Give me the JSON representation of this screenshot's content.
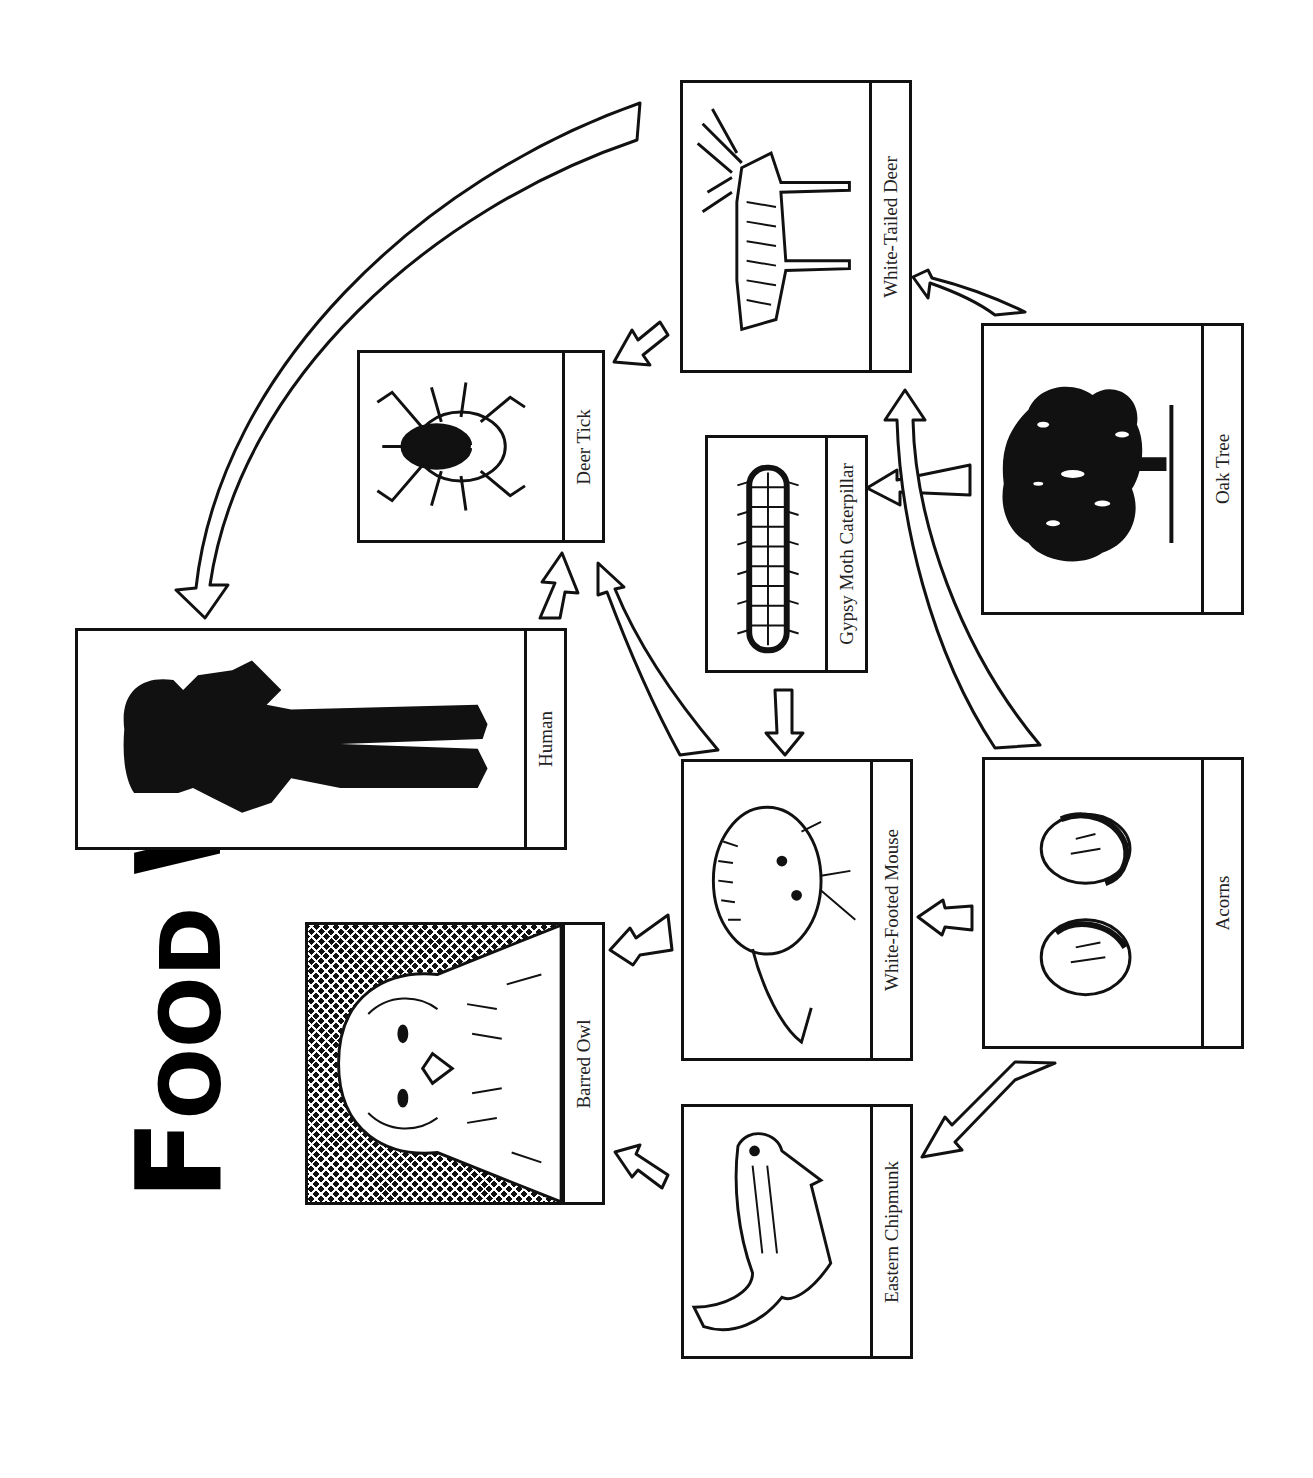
{
  "title": {
    "first_letter": "F",
    "rest_word1": "OOD",
    "second_word_first": "W",
    "rest_word2": "EB",
    "full": "Food Web"
  },
  "orientation": "rotated 90 degrees counter-clockwise",
  "organisms": [
    {
      "id": "deer",
      "label": "White-Tailed Deer",
      "icon": "deer-icon"
    },
    {
      "id": "tick",
      "label": "Deer Tick",
      "icon": "tick-icon"
    },
    {
      "id": "caterpillar",
      "label": "Gypsy Moth Caterpillar",
      "icon": "caterpillar-icon"
    },
    {
      "id": "oak",
      "label": "Oak Tree",
      "icon": "oak-tree-icon"
    },
    {
      "id": "human",
      "label": "Human",
      "icon": "human-silhouette-icon"
    },
    {
      "id": "mouse",
      "label": "White-Footed Mouse",
      "icon": "mouse-icon"
    },
    {
      "id": "acorns",
      "label": "Acorns",
      "icon": "acorns-icon"
    },
    {
      "id": "owl",
      "label": "Barred Owl",
      "icon": "owl-icon"
    },
    {
      "id": "chipmunk",
      "label": "Eastern Chipmunk",
      "icon": "chipmunk-icon"
    }
  ],
  "links": [
    {
      "from": "Oak Tree",
      "to": "White-Tailed Deer"
    },
    {
      "from": "Oak Tree",
      "to": "Gypsy Moth Caterpillar"
    },
    {
      "from": "Acorns",
      "to": "White-Tailed Deer"
    },
    {
      "from": "Acorns",
      "to": "White-Footed Mouse"
    },
    {
      "from": "Acorns",
      "to": "Eastern Chipmunk"
    },
    {
      "from": "Gypsy Moth Caterpillar",
      "to": "White-Footed Mouse"
    },
    {
      "from": "White-Tailed Deer",
      "to": "Deer Tick"
    },
    {
      "from": "White-Tailed Deer",
      "to": "Human"
    },
    {
      "from": "White-Footed Mouse",
      "to": "Deer Tick"
    },
    {
      "from": "White-Footed Mouse",
      "to": "Deer Tick"
    },
    {
      "from": "White-Footed Mouse",
      "to": "Barred Owl"
    },
    {
      "from": "Eastern Chipmunk",
      "to": "Barred Owl"
    }
  ],
  "colors": {
    "ink": "#111111",
    "background": "#ffffff"
  }
}
